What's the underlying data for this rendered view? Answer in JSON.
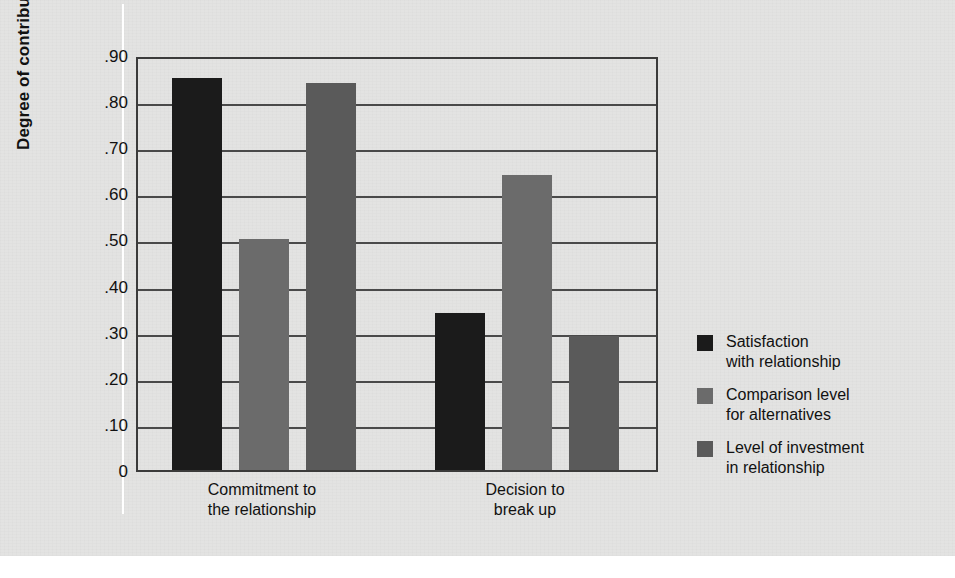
{
  "figure": {
    "background_color": "#e3e3e2",
    "axis_title": "Degree of contribution",
    "frame_color": "#3b3b3b"
  },
  "chart_data": {
    "type": "bar",
    "title": "",
    "subtitle": "",
    "xlabel": "",
    "ylabel": "Degree of contribution",
    "categories": [
      "Commitment to the relationship",
      "Decision to break up"
    ],
    "category_lines": [
      [
        "Commitment to",
        "the relationship"
      ],
      [
        "Decision to",
        "break up"
      ]
    ],
    "series": [
      {
        "name": "Satisfaction with relationship",
        "name_lines": [
          "Satisfaction",
          "with relationship"
        ],
        "color": "#1b1b1b",
        "values": [
          0.85,
          0.34
        ]
      },
      {
        "name": "Comparison level for alternatives",
        "name_lines": [
          "Comparison level",
          "for alternatives"
        ],
        "color": "#6b6b6b",
        "values": [
          0.5,
          0.64
        ]
      },
      {
        "name": "Level of investment in relationship",
        "name_lines": [
          "Level of investment",
          "in relationship"
        ],
        "color": "#5a5a5a",
        "values": [
          0.84,
          0.29
        ]
      }
    ],
    "ylim": [
      0,
      0.9
    ],
    "ytick_values": [
      0.9,
      0.8,
      0.7,
      0.6,
      0.5,
      0.4,
      0.3,
      0.2,
      0.1,
      0
    ],
    "ytick_labels": [
      ".90",
      ".80",
      ".70",
      ".60",
      ".50",
      ".40",
      ".30",
      ".20",
      ".10",
      "0"
    ],
    "grid": true,
    "grid_axis": "y",
    "legend_position": "right",
    "bar_width_px": 50
  }
}
